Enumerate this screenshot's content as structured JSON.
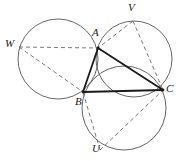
{
  "figure": {
    "type": "geometry-diagram",
    "width": 185,
    "height": 161,
    "background_color": "#ffffff",
    "stroke_color_solid": "#1a1a1a",
    "stroke_color_circle": "#555555",
    "stroke_color_dashed": "#6a6a6a"
  },
  "points": [
    {
      "id": "A",
      "label": "A",
      "x": 98,
      "y": 48,
      "label_x": 92,
      "label_y": 27,
      "kind": "triangle-vertex"
    },
    {
      "id": "B",
      "label": "B",
      "x": 83,
      "y": 92,
      "label_x": 75,
      "label_y": 96,
      "kind": "triangle-vertex"
    },
    {
      "id": "C",
      "label": "C",
      "x": 163,
      "y": 90,
      "label_x": 166,
      "label_y": 83,
      "kind": "triangle-vertex"
    },
    {
      "id": "W",
      "label": "W",
      "x": 19,
      "y": 47,
      "label_x": 5,
      "label_y": 38,
      "kind": "apex-point"
    },
    {
      "id": "V",
      "label": "V",
      "x": 133,
      "y": 21,
      "label_x": 128,
      "label_y": 2,
      "kind": "apex-point"
    },
    {
      "id": "U",
      "label": "U",
      "x": 100,
      "y": 150,
      "label_x": 92,
      "label_y": 143,
      "kind": "apex-point"
    }
  ],
  "circles": [
    {
      "id": "circle-ABW",
      "through": "A, B, W",
      "cx": 58,
      "cy": 59,
      "r": 40
    },
    {
      "id": "circle-ACV",
      "through": "A, C, V",
      "cx": 134,
      "cy": 59,
      "r": 38
    },
    {
      "id": "circle-BCU",
      "through": "B, C, U",
      "cx": 124,
      "cy": 108,
      "r": 42
    }
  ],
  "solid_segments": [
    {
      "id": "segment-AB",
      "from": "A",
      "to": "B"
    },
    {
      "id": "segment-BC",
      "from": "B",
      "to": "C"
    },
    {
      "id": "segment-CA",
      "from": "C",
      "to": "A"
    }
  ],
  "dashed_segments": [
    {
      "id": "segment-WA",
      "from": "W",
      "to": "A"
    },
    {
      "id": "segment-WB",
      "from": "W",
      "to": "B"
    },
    {
      "id": "segment-VA",
      "from": "V",
      "to": "A"
    },
    {
      "id": "segment-VC",
      "from": "V",
      "to": "C"
    },
    {
      "id": "segment-UB",
      "from": "U",
      "to": "B"
    },
    {
      "id": "segment-UC",
      "from": "U",
      "to": "C"
    }
  ]
}
